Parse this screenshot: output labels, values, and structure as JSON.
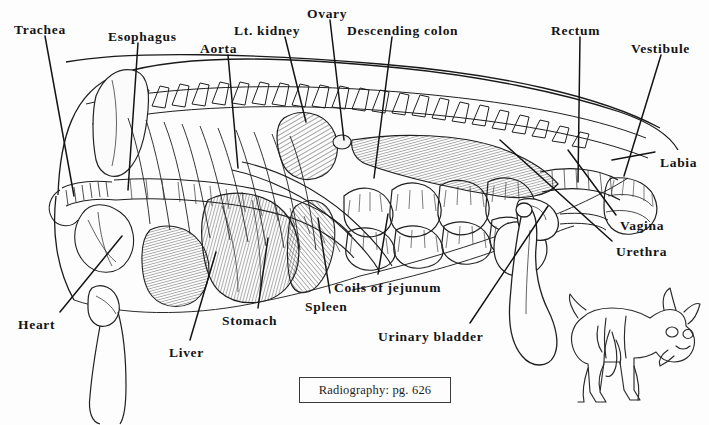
{
  "figure": {
    "background_color": "#fdfdfd",
    "ink_color": "#141414",
    "width": 709,
    "height": 425
  },
  "labels": [
    {
      "id": "trachea",
      "text": "Trachea",
      "x": 14,
      "y": 23,
      "anchor": "start"
    },
    {
      "id": "esophagus",
      "text": "Esophagus",
      "x": 108,
      "y": 30,
      "anchor": "start"
    },
    {
      "id": "aorta",
      "text": "Aorta",
      "x": 200,
      "y": 42,
      "anchor": "start"
    },
    {
      "id": "lt-kidney",
      "text": "Lt. kidney",
      "x": 234,
      "y": 24,
      "anchor": "start"
    },
    {
      "id": "ovary",
      "text": "Ovary",
      "x": 307,
      "y": 7,
      "anchor": "start"
    },
    {
      "id": "descending-colon",
      "text": "Descending colon",
      "x": 347,
      "y": 24,
      "anchor": "start"
    },
    {
      "id": "rectum",
      "text": "Rectum",
      "x": 551,
      "y": 24,
      "anchor": "start"
    },
    {
      "id": "vestibule",
      "text": "Vestibule",
      "x": 631,
      "y": 42,
      "anchor": "start"
    },
    {
      "id": "labia",
      "text": "Labia",
      "x": 660,
      "y": 156,
      "anchor": "start"
    },
    {
      "id": "vagina",
      "text": "Vagina",
      "x": 620,
      "y": 219,
      "anchor": "start"
    },
    {
      "id": "urethra",
      "text": "Urethra",
      "x": 616,
      "y": 245,
      "anchor": "start"
    },
    {
      "id": "coils-of-jejunum",
      "text": "Coils of jejunum",
      "x": 334,
      "y": 281,
      "anchor": "start"
    },
    {
      "id": "urinary-bladder",
      "text": "Urinary bladder",
      "x": 378,
      "y": 330,
      "anchor": "start"
    },
    {
      "id": "spleen",
      "text": "Spleen",
      "x": 305,
      "y": 300,
      "anchor": "start"
    },
    {
      "id": "stomach",
      "text": "Stomach",
      "x": 222,
      "y": 314,
      "anchor": "start"
    },
    {
      "id": "liver",
      "text": "Liver",
      "x": 169,
      "y": 346,
      "anchor": "start"
    },
    {
      "id": "heart",
      "text": "Heart",
      "x": 18,
      "y": 318,
      "anchor": "start"
    }
  ],
  "caption": {
    "text": "Radiography: pg. 626",
    "border_color": "#3a3a3a"
  },
  "inset": {
    "name": "dog-silhouette-inset",
    "description": "small line drawing of a dog standing, facing right"
  }
}
